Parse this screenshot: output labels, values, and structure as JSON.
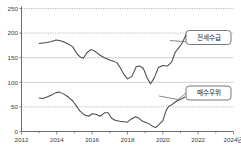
{
  "chart_data": {
    "type": "line",
    "title": "",
    "subtitle": "",
    "xlabel": "",
    "ylabel": "",
    "xlim": [
      2012,
      2024
    ],
    "ylim": [
      0,
      250
    ],
    "grid": true,
    "legend_position": "inline-callout",
    "y_ticks": [
      "0",
      "50",
      "100",
      "150",
      "200",
      "250"
    ],
    "y_tick_values": [
      0,
      50,
      100,
      150,
      200,
      250
    ],
    "x_ticks": [
      "2012",
      "2014",
      "2016",
      "2018",
      "2020",
      "2022",
      "2024년"
    ],
    "x_tick_values": [
      2012,
      2014,
      2016,
      2018,
      2020,
      2022,
      2024
    ],
    "series": [
      {
        "name": "전세수급",
        "color": "#4a4a4a",
        "callout_label": "전세수급",
        "x": [
          2013.0,
          2013.2,
          2013.45,
          2013.7,
          2013.95,
          2014.15,
          2014.4,
          2014.65,
          2014.9,
          2015.1,
          2015.3,
          2015.5,
          2015.7,
          2015.95,
          2016.2,
          2016.45,
          2016.7,
          2016.95,
          2017.2,
          2017.4,
          2017.6,
          2017.8,
          2018.0,
          2018.25,
          2018.5,
          2018.7,
          2018.9,
          2019.1,
          2019.3,
          2019.5,
          2019.75,
          2020.0,
          2020.25,
          2020.5,
          2020.7,
          2020.9,
          2021.1,
          2021.3
        ],
        "y": [
          179,
          180,
          181,
          183,
          186,
          185,
          182,
          178,
          172,
          160,
          152,
          149,
          160,
          167,
          162,
          155,
          150,
          146,
          143,
          140,
          129,
          116,
          107,
          112,
          132,
          133,
          128,
          110,
          97,
          108,
          130,
          134,
          133,
          141,
          161,
          170,
          180,
          196
        ]
      },
      {
        "name": "매수우위",
        "color": "#4a4a4a",
        "callout_label": "매수우위",
        "x": [
          2013.0,
          2013.2,
          2013.45,
          2013.7,
          2013.95,
          2014.15,
          2014.4,
          2014.65,
          2014.9,
          2015.1,
          2015.3,
          2015.55,
          2015.8,
          2016.0,
          2016.2,
          2016.45,
          2016.7,
          2016.9,
          2017.1,
          2017.3,
          2017.55,
          2017.8,
          2018.0,
          2018.2,
          2018.45,
          2018.6,
          2018.8,
          2019.0,
          2019.2,
          2019.45,
          2019.6,
          2019.8,
          2020.0,
          2020.2,
          2020.35,
          2020.5,
          2020.7,
          2020.9,
          2021.05,
          2021.25
        ],
        "y": [
          68,
          67,
          70,
          74,
          79,
          80,
          76,
          70,
          62,
          52,
          42,
          34,
          31,
          36,
          35,
          31,
          38,
          38,
          27,
          23,
          21,
          20,
          19,
          25,
          30,
          28,
          22,
          19,
          16,
          10,
          8,
          15,
          22,
          44,
          52,
          54,
          60,
          64,
          66,
          70
        ]
      }
    ]
  },
  "callouts": [
    {
      "name": "jeonse-supply",
      "label": "전세수급"
    },
    {
      "name": "buyer-advantage",
      "label": "매수우위"
    }
  ]
}
